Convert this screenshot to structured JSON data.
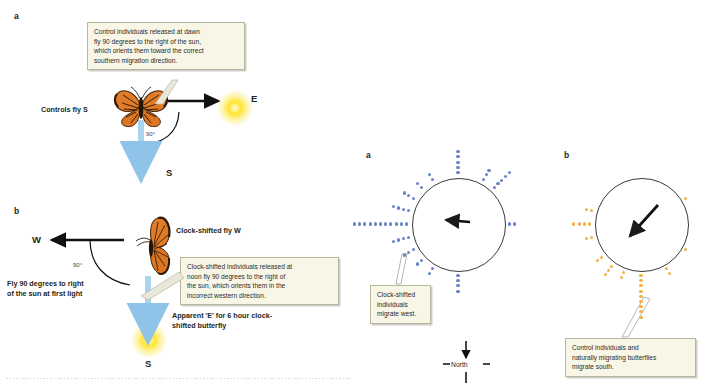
{
  "figure": {
    "colors": {
      "dot_blue": "#6b85c4",
      "dot_orange": "#f4b04a",
      "callout_bg": "#f7f6e7",
      "callout_border": "#b9b6a0",
      "sun_yellow": "#ffe93f",
      "arrow_black": "#111111",
      "arrow_blue": "#8fc4e8"
    }
  },
  "left_panel_a": {
    "letter": "a",
    "callout": [
      "Control individuals released at dawn",
      "fly 90 degrees to the right of the sun,",
      "which orients them toward the correct",
      "southern migration direction."
    ],
    "label_controls": "Controls fly S",
    "label_east": "E",
    "label_south": "S",
    "label_angle": "90°"
  },
  "left_panel_b": {
    "letter": "b",
    "label_clock_shifted": "Clock-shifted fly W",
    "callout": [
      "Clock-shifted individuals released at",
      "noon fly 90 degrees to the right of",
      "the sun, which orients them in the",
      "incorrect western direction."
    ],
    "label_west": "W",
    "label_angle": "90°",
    "label_fly90": "Fly 90 degrees to right of the sun at first light",
    "label_apparent": "Apparent 'E' for 6 hour clock-shifted butterfly",
    "label_south": "S"
  },
  "right_panel_a": {
    "letter": "a",
    "callout": [
      "Clock-shifted",
      "individuals",
      "migrate west."
    ],
    "mean_vector_direction_deg": 272,
    "compass": {
      "label": "North",
      "left_tick": "—",
      "right_tick": "—"
    }
  },
  "right_panel_b": {
    "letter": "b",
    "callout": [
      "Control individuals and",
      "naturally migrating butterflies",
      "migrate south."
    ],
    "mean_vector_direction_deg": 200
  },
  "chart_data": {
    "type": "scatter",
    "plots": [
      {
        "name": "Clock-shifted individuals",
        "letter": "a",
        "dot_color": "#6b85c4",
        "mean_vector_bearing_deg": 272,
        "mean_vector_label": "west",
        "total_dots": 52,
        "bearing_stacks": [
          {
            "bearing_deg": 270,
            "count": 11
          },
          {
            "bearing_deg": 255,
            "count": 4
          },
          {
            "bearing_deg": 285,
            "count": 4
          },
          {
            "bearing_deg": 240,
            "count": 3
          },
          {
            "bearing_deg": 300,
            "count": 3
          },
          {
            "bearing_deg": 225,
            "count": 2
          },
          {
            "bearing_deg": 315,
            "count": 2
          },
          {
            "bearing_deg": 210,
            "count": 2
          },
          {
            "bearing_deg": 330,
            "count": 2
          },
          {
            "bearing_deg": 180,
            "count": 4
          },
          {
            "bearing_deg": 0,
            "count": 5
          },
          {
            "bearing_deg": 45,
            "count": 5
          },
          {
            "bearing_deg": 30,
            "count": 3
          },
          {
            "bearing_deg": 90,
            "count": 2
          }
        ]
      },
      {
        "name": "Control and naturally migrating butterflies",
        "letter": "b",
        "dot_color": "#f4b04a",
        "mean_vector_bearing_deg": 200,
        "mean_vector_label": "south",
        "total_dots": 28,
        "bearing_stacks": [
          {
            "bearing_deg": 180,
            "count": 9
          },
          {
            "bearing_deg": 200,
            "count": 2
          },
          {
            "bearing_deg": 215,
            "count": 3
          },
          {
            "bearing_deg": 230,
            "count": 2
          },
          {
            "bearing_deg": 270,
            "count": 4
          },
          {
            "bearing_deg": 255,
            "count": 2
          },
          {
            "bearing_deg": 285,
            "count": 2
          },
          {
            "bearing_deg": 150,
            "count": 2
          },
          {
            "bearing_deg": 60,
            "count": 1
          },
          {
            "bearing_deg": 120,
            "count": 1
          }
        ]
      }
    ],
    "axis_reference": "North is up (0°); bearings increase clockwise.",
    "grid": false,
    "legend": "none"
  }
}
